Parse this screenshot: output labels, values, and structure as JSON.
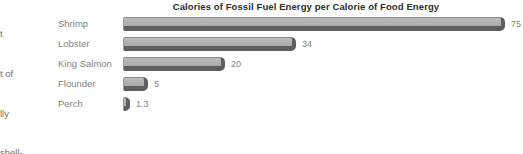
{
  "page": {
    "left_text_fragments": [
      "t",
      "t of",
      "lly",
      "shell-"
    ]
  },
  "chart_data": {
    "type": "bar",
    "orientation": "horizontal",
    "title": "Calories of Fossil Fuel Energy per Calorie of Food Energy",
    "categories": [
      "Shrimp",
      "Lobster",
      "King Salmon",
      "Flounder",
      "Perch"
    ],
    "values": [
      75,
      34,
      20,
      5,
      1.3
    ],
    "value_labels": [
      "75",
      "34",
      "20",
      "5",
      "1.3"
    ],
    "xlabel": "",
    "ylabel": "",
    "xlim": [
      0,
      78
    ],
    "grid": false,
    "legend": false,
    "value_labels_position": "right-of-bar",
    "colors": {
      "bar_face": "#b1b1b1",
      "bar_shadow": "#5e5e5e",
      "title_text": "#2e2e2e",
      "label_text": "#838383",
      "background": "#ffffff"
    }
  }
}
